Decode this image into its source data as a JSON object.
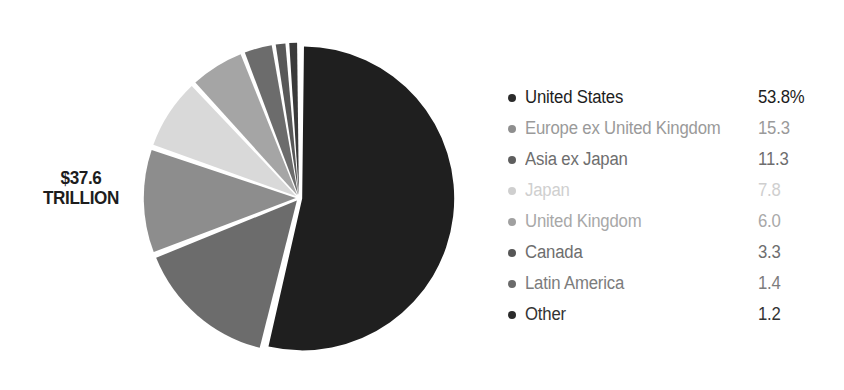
{
  "center_label": {
    "amount": "$37.6",
    "unit": "TRILLION"
  },
  "chart_data": {
    "type": "pie",
    "title": "",
    "subtitle": "",
    "xlabel": "",
    "ylabel": "",
    "units": "percent",
    "total_label": "$37.6 TRILLION",
    "legend_position": "right",
    "grid": false,
    "start_angle_deg": 0,
    "direction": "clockwise",
    "categories": [
      "United States",
      "Europe ex United Kingdom",
      "Asia ex Japan",
      "Japan",
      "United Kingdom",
      "Canada",
      "Latin America",
      "Other"
    ],
    "values": [
      53.8,
      15.3,
      11.3,
      7.8,
      6.0,
      3.3,
      1.4,
      1.2
    ],
    "value_labels": [
      "53.8%",
      "15.3",
      "11.3",
      "7.8",
      "6.0",
      "3.3",
      "1.4",
      "1.2"
    ],
    "colors": [
      "#1f1f1f",
      "#6c6c6c",
      "#8d8d8d",
      "#d9d9d9",
      "#a5a5a5",
      "#6c6c6c",
      "#585858",
      "#3a3a3a"
    ],
    "slices": [
      {
        "name": "United States",
        "value": 53.8,
        "label": "53.8%",
        "color": "#1f1f1f",
        "text_color": "#1d1d1d",
        "bullet_color": "#2b2b2b"
      },
      {
        "name": "Europe ex United Kingdom",
        "value": 15.3,
        "label": "15.3",
        "color": "#6c6c6c",
        "text_color": "#9a9a9a",
        "bullet_color": "#8e8e8e"
      },
      {
        "name": "Asia ex Japan",
        "value": 11.3,
        "label": "11.3",
        "color": "#8d8d8d",
        "text_color": "#6e6e6e",
        "bullet_color": "#5e5e5e"
      },
      {
        "name": "Japan",
        "value": 7.8,
        "label": "7.8",
        "color": "#d9d9d9",
        "text_color": "#cfcfcf",
        "bullet_color": "#cfcfcf"
      },
      {
        "name": "United Kingdom",
        "value": 6.0,
        "label": "6.0",
        "color": "#a5a5a5",
        "text_color": "#a8a8a8",
        "bullet_color": "#a0a0a0"
      },
      {
        "name": "Canada",
        "value": 3.3,
        "label": "3.3",
        "color": "#6c6c6c",
        "text_color": "#6e6e6e",
        "bullet_color": "#565656"
      },
      {
        "name": "Latin America",
        "value": 1.4,
        "label": "1.4",
        "color": "#585858",
        "text_color": "#7c7c7c",
        "bullet_color": "#6a6a6a"
      },
      {
        "name": "Other",
        "value": 1.2,
        "label": "1.2",
        "color": "#3a3a3a",
        "text_color": "#333333",
        "bullet_color": "#2b2b2b"
      }
    ]
  }
}
